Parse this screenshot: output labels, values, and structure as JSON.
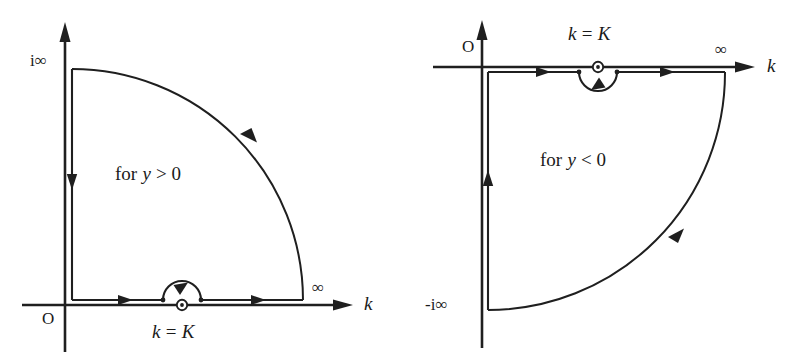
{
  "figure": {
    "panels": [
      {
        "id": "left",
        "region_label": "for y > 0",
        "region_label_parts": {
          "lead": "for",
          "variable": "y",
          "relation": "> 0"
        },
        "axis_label_horizontal": "k",
        "axis_label_vertical": "",
        "origin_label": "O",
        "vertical_end_label": "i∞",
        "horizontal_end_label": "∞",
        "pole_label": "k = K",
        "pole_label_parts": {
          "variable": "k",
          "equals": "=",
          "value": "K"
        },
        "pole_detour_side": "above",
        "quadrant": "first",
        "arc_direction": "counterclockwise",
        "path_arrows": [
          "right",
          "right",
          "up-left-along-arc",
          "down"
        ]
      },
      {
        "id": "right",
        "region_label": "for y < 0",
        "region_label_parts": {
          "lead": "for",
          "variable": "y",
          "relation": "< 0"
        },
        "axis_label_horizontal": "k",
        "axis_label_vertical": "",
        "origin_label": "O",
        "vertical_end_label": "-i∞",
        "horizontal_end_label": "∞",
        "pole_label": "k = K",
        "pole_label_parts": {
          "variable": "k",
          "equals": "=",
          "value": "K"
        },
        "pole_detour_side": "below",
        "quadrant": "fourth",
        "arc_direction": "clockwise",
        "path_arrows": [
          "right",
          "right",
          "down-left-along-arc",
          "up"
        ]
      }
    ],
    "colors": {
      "ink": "#1f1f1f",
      "background": "#ffffff"
    }
  }
}
